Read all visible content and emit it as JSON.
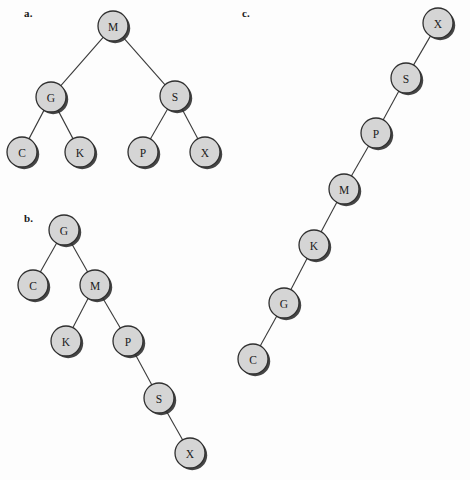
{
  "figure": {
    "background_color": "#fdfdfd",
    "node_fill_color": "#d5d5d5",
    "node_stroke_color": "#2f2f2f",
    "edge_color": "#3a3a3a",
    "node_radius": 15,
    "width": 470,
    "height": 480
  },
  "panels": [
    {
      "id": "a",
      "label": "a.",
      "label_x": 24,
      "label_y": 7,
      "nodes": [
        {
          "key": "M",
          "x": 113,
          "y": 26
        },
        {
          "key": "G",
          "x": 51,
          "y": 97
        },
        {
          "key": "S",
          "x": 175,
          "y": 96
        },
        {
          "key": "C",
          "x": 22,
          "y": 152
        },
        {
          "key": "K",
          "x": 80,
          "y": 152
        },
        {
          "key": "P",
          "x": 143,
          "y": 152
        },
        {
          "key": "X",
          "x": 205,
          "y": 152
        }
      ],
      "edges": [
        {
          "from": "M",
          "to": "G"
        },
        {
          "from": "M",
          "to": "S"
        },
        {
          "from": "G",
          "to": "C"
        },
        {
          "from": "G",
          "to": "K"
        },
        {
          "from": "S",
          "to": "P"
        },
        {
          "from": "S",
          "to": "X"
        }
      ]
    },
    {
      "id": "b",
      "label": "b.",
      "label_x": 24,
      "label_y": 212,
      "nodes": [
        {
          "key": "G",
          "x": 64,
          "y": 230
        },
        {
          "key": "C",
          "x": 33,
          "y": 285
        },
        {
          "key": "M",
          "x": 95,
          "y": 285
        },
        {
          "key": "K",
          "x": 66,
          "y": 341
        },
        {
          "key": "P",
          "x": 128,
          "y": 341
        },
        {
          "key": "S",
          "x": 159,
          "y": 398
        },
        {
          "key": "X",
          "x": 190,
          "y": 453
        }
      ],
      "edges": [
        {
          "from": "G",
          "to": "C"
        },
        {
          "from": "G",
          "to": "M"
        },
        {
          "from": "M",
          "to": "K"
        },
        {
          "from": "M",
          "to": "P"
        },
        {
          "from": "P",
          "to": "S"
        },
        {
          "from": "S",
          "to": "X"
        }
      ]
    },
    {
      "id": "c",
      "label": "c.",
      "label_x": 242,
      "label_y": 7,
      "nodes": [
        {
          "key": "X",
          "x": 438,
          "y": 23
        },
        {
          "key": "S",
          "x": 406,
          "y": 78
        },
        {
          "key": "P",
          "x": 376,
          "y": 133
        },
        {
          "key": "M",
          "x": 344,
          "y": 189
        },
        {
          "key": "K",
          "x": 314,
          "y": 245
        },
        {
          "key": "G",
          "x": 284,
          "y": 303
        },
        {
          "key": "C",
          "x": 253,
          "y": 359
        }
      ],
      "edges": [
        {
          "from": "X",
          "to": "S"
        },
        {
          "from": "S",
          "to": "P"
        },
        {
          "from": "P",
          "to": "M"
        },
        {
          "from": "M",
          "to": "K"
        },
        {
          "from": "K",
          "to": "G"
        },
        {
          "from": "G",
          "to": "C"
        }
      ]
    }
  ]
}
